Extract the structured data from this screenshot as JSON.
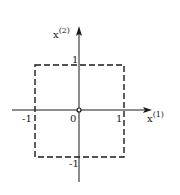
{
  "diagram": {
    "axes": {
      "horizontal": {
        "base": "x",
        "superscript": "(1)"
      },
      "vertical": {
        "base": "x",
        "superscript": "(2)"
      }
    },
    "ticks": {
      "x_pos": "1",
      "x_neg": "-1",
      "y_pos": "1",
      "y_neg": "-1",
      "origin": "0"
    },
    "square": {
      "corners": [
        [
          -1,
          1
        ],
        [
          1,
          1
        ],
        [
          1,
          -1
        ],
        [
          -1,
          -1
        ]
      ],
      "style": "dashed"
    },
    "colors": {
      "ink": "#1a1a1a",
      "background": "#ffffff"
    }
  }
}
